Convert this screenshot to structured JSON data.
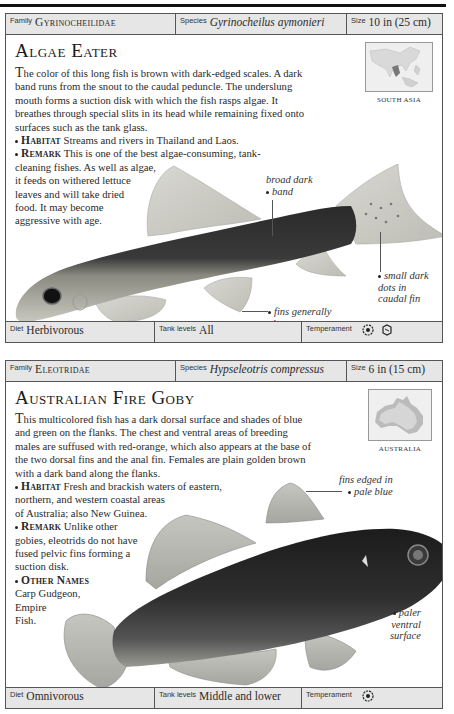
{
  "cards": [
    {
      "header": {
        "family_label": "Family",
        "family": "Gyrinocheilidae",
        "species_label": "Species",
        "species": "Gyrinocheilus aymonieri",
        "size_label": "Size",
        "size": "10 in (25 cm)"
      },
      "title": "Algae Eater",
      "description": "he color of this long fish is brown with dark-edged scales. A dark band runs from the snout to the caudal peduncle. The underslung mouth forms a suction disk with which the fish rasps algae. It breathes through special slits in its head while remaining fixed onto surfaces such as the tank glass.",
      "description_initial": "T",
      "habitat_label": "Habitat",
      "habitat": "Streams and rivers in Thailand and Laos.",
      "remark_label": "Remark",
      "remark_line1": "This is one of the best algae-consuming, tank-",
      "remark_line2": "cleaning fishes. As well as algae,",
      "remark_line3": "it feeds on withered lettuce",
      "remark_line4": "leaves and will take dried",
      "remark_line5": "food. It may become",
      "remark_line6": "aggressive with age.",
      "map_label": "SOUTH ASIA",
      "annotations": {
        "a1_line1": "broad dark",
        "a1_line2": "band",
        "a2_line1": "small dark",
        "a2_line2": "dots in",
        "a2_line3": "caudal fin",
        "a3_line1": "fins generally",
        "a3_line2": "clear"
      },
      "footer": {
        "diet_label": "Diet",
        "diet": "Herbivorous",
        "tank_label": "Tank levels",
        "tank": "All",
        "temperament_label": "Temperament",
        "temperament_icons": [
          "community-fish-icon",
          "aggressive-fish-icon"
        ]
      }
    },
    {
      "header": {
        "family_label": "Family",
        "family": "Eleotridae",
        "species_label": "Species",
        "species": "Hypseleotris compressus",
        "size_label": "Size",
        "size": "6 in (15 cm)"
      },
      "title": "Australian Fire Goby",
      "description": "his multicolored fish has a dark dorsal surface and shades of blue and green on the flanks. The chest and ventral areas of breeding males are suffused with red-orange, which also appears at the base of the two dorsal fins and the anal fin. Females are plain golden brown with a dark band along the flanks.",
      "description_initial": "T",
      "habitat_label": "Habitat",
      "habitat_line1": "Fresh and brackish waters of eastern,",
      "habitat_line2": "northern, and western coastal areas",
      "habitat_line3": "of Australia; also New Guinea.",
      "remark_label": "Remark",
      "remark_line1": "Unlike other",
      "remark_line2": "gobies, eleotrids do not have",
      "remark_line3": "fused pelvic fins forming a",
      "remark_line4": "suction disk.",
      "other_names_label": "Other Names",
      "other_names_line1": "Carp Gudgeon,",
      "other_names_line2": "Empire",
      "other_names_line3": "Fish.",
      "map_label": "AUSTRALIA",
      "annotations": {
        "a1_line1": "fins edged in",
        "a1_line2": "pale blue",
        "a2_line1": "paler",
        "a2_line2": "ventral",
        "a2_line3": "surface"
      },
      "footer": {
        "diet_label": "Diet",
        "diet": "Omnivorous",
        "tank_label": "Tank levels",
        "tank": "Middle and lower",
        "temperament_label": "Temperament",
        "temperament_icons": [
          "community-fish-icon"
        ]
      }
    }
  ]
}
